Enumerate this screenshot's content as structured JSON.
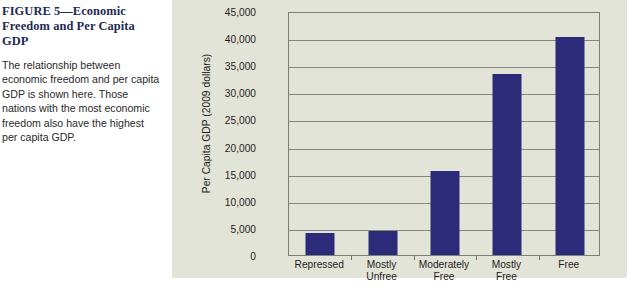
{
  "caption": {
    "title": "FIGURE 5—Economic Freedom and Per Capita GDP",
    "description": "The relationship between economic freedom and per capita GDP is shown here. Those nations with the most economic freedom also have the highest per capita GDP."
  },
  "colors": {
    "bar": "#2b2b7a",
    "panel_background": "#e3e4d8",
    "title": "#1d2a54",
    "gridline": "#86877c",
    "axis": "#7d7e74"
  },
  "chart_data": {
    "type": "bar",
    "title": "",
    "xlabel": "",
    "ylabel": "Per Capita GDP (2009 dollars)",
    "categories": [
      "Repressed",
      "Mostly Unfree",
      "Moderately Free",
      "Mostly Free",
      "Free"
    ],
    "category_lines": [
      [
        "Repressed"
      ],
      [
        "Mostly",
        "Unfree"
      ],
      [
        "Moderately",
        "Free"
      ],
      [
        "Mostly",
        "Free"
      ],
      [
        "Free"
      ]
    ],
    "values": [
      4000,
      4400,
      15500,
      33400,
      40200
    ],
    "ylim": [
      0,
      45000
    ],
    "ytick_step": 5000,
    "ytick_labels": [
      "45,000",
      "40,000",
      "35,000",
      "30,000",
      "25,000",
      "20,000",
      "15,000",
      "10,000",
      "5,000",
      "0"
    ],
    "ytick_values": [
      45000,
      40000,
      35000,
      30000,
      25000,
      20000,
      15000,
      10000,
      5000,
      0
    ],
    "grid": true,
    "legend": "none"
  }
}
